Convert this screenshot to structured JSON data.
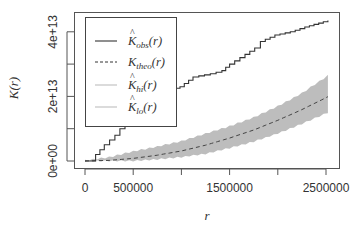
{
  "chart_data": {
    "type": "line",
    "title": "",
    "xlabel": "r",
    "ylabel": "K(r)",
    "xlim": [
      -100000,
      2650000
    ],
    "ylim": [
      -2000000000000.0,
      45000000000000.0
    ],
    "grid": false,
    "legend_position": "top-left",
    "x_ticks": [
      0,
      500000,
      1000000,
      1500000,
      2000000,
      2500000
    ],
    "x_tick_labels": [
      "0",
      "500000",
      "",
      "1500000",
      "",
      "2500000"
    ],
    "y_ticks": [
      0,
      10000000000000.0,
      20000000000000.0,
      30000000000000.0,
      40000000000000.0
    ],
    "y_tick_labels": [
      "0e+00",
      "",
      "2e+13",
      "",
      "4e+13"
    ],
    "legend": [
      {
        "key": "obs",
        "label_main": "K",
        "label_hat": true,
        "label_sub": "obs",
        "label_tail": "(r)",
        "style": "solid",
        "color": "#333333"
      },
      {
        "key": "theo",
        "label_main": "K",
        "label_hat": false,
        "label_sub": "theo",
        "label_tail": "(r)",
        "style": "dashed",
        "color": "#333333"
      },
      {
        "key": "hi",
        "label_main": "K",
        "label_hat": true,
        "label_sub": "hi",
        "label_tail": "(r)",
        "style": "solid",
        "color": "#bdbdbd"
      },
      {
        "key": "lo",
        "label_main": "K",
        "label_hat": true,
        "label_sub": "lo",
        "label_tail": "(r)",
        "style": "solid",
        "color": "#bdbdbd"
      }
    ],
    "series": [
      {
        "name": "K_obs(r)",
        "style": "step",
        "x": [
          0,
          100000,
          110000,
          200000,
          310000,
          415000,
          520000,
          620000,
          725000,
          880000,
          985000,
          1120000,
          1300000,
          1420000,
          1500000,
          1660000,
          1760000,
          1820000,
          1970000,
          2130000,
          2280000,
          2520000
        ],
        "y": [
          0,
          0,
          2000000000000.0,
          5000000000000.0,
          8000000000000.0,
          12000000000000.0,
          15000000000000.0,
          18000000000000.0,
          20000000000000.0,
          22000000000000.0,
          23000000000000.0,
          26000000000000.0,
          27000000000000.0,
          28000000000000.0,
          30000000000000.0,
          33000000000000.0,
          35000000000000.0,
          37000000000000.0,
          39000000000000.0,
          40000000000000.0,
          41500000000000.0,
          43500000000000.0
        ]
      },
      {
        "name": "K_theo(r)",
        "style": "dashed",
        "x": [
          0,
          250000,
          500000,
          750000,
          1000000,
          1250000,
          1500000,
          1750000,
          2000000,
          2250000,
          2520000
        ],
        "y": [
          0,
          200000000000.0,
          800000000000.0,
          1800000000000.0,
          3100000000000.0,
          4900000000000.0,
          7100000000000.0,
          9600000000000.0,
          12600000000000.0,
          15900000000000.0,
          19900000000000.0
        ]
      },
      {
        "name": "K_hi(r)",
        "style": "envelope-upper",
        "x": [
          0,
          250000,
          500000,
          750000,
          1000000,
          1250000,
          1500000,
          1750000,
          2000000,
          2250000,
          2520000
        ],
        "y": [
          200000000000.0,
          1200000000000.0,
          3000000000000.0,
          4500000000000.0,
          6200000000000.0,
          8500000000000.0,
          10800000000000.0,
          13500000000000.0,
          17000000000000.0,
          21000000000000.0,
          26500000000000.0
        ]
      },
      {
        "name": "K_lo(r)",
        "style": "envelope-lower",
        "x": [
          0,
          250000,
          500000,
          750000,
          1000000,
          1250000,
          1500000,
          1750000,
          2000000,
          2250000,
          2520000
        ],
        "y": [
          0,
          0,
          0.0,
          500000000000.0,
          1200000000000.0,
          2200000000000.0,
          4000000000000.0,
          6000000000000.0,
          8500000000000.0,
          11500000000000.0,
          15000000000000.0
        ]
      }
    ],
    "colors": {
      "observed": "#333333",
      "theoretical": "#444444",
      "envelope_fill": "#bdbdbd",
      "axis": "#555555",
      "text": "#333333"
    }
  }
}
